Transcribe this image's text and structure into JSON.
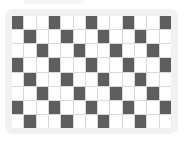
{
  "pattern": {
    "rows": 8,
    "cols": 13,
    "rule": "dark where (col - row) mod 3 == 0, 1-indexed",
    "dark_color": "#5e5e5e",
    "light_color": "#ffffff",
    "line_color": "#d9d9d9",
    "frame_color": "#f1f1f1",
    "dark_cells": [
      [
        1,
        4,
        7,
        10,
        13
      ],
      [
        2,
        5,
        8,
        11
      ],
      [
        3,
        6,
        9,
        12
      ],
      [
        1,
        4,
        7,
        10,
        13
      ],
      [
        2,
        5,
        8,
        11
      ],
      [
        3,
        6,
        9,
        12
      ],
      [
        1,
        4,
        7,
        10,
        13
      ],
      [
        2,
        5,
        8,
        11
      ]
    ]
  }
}
